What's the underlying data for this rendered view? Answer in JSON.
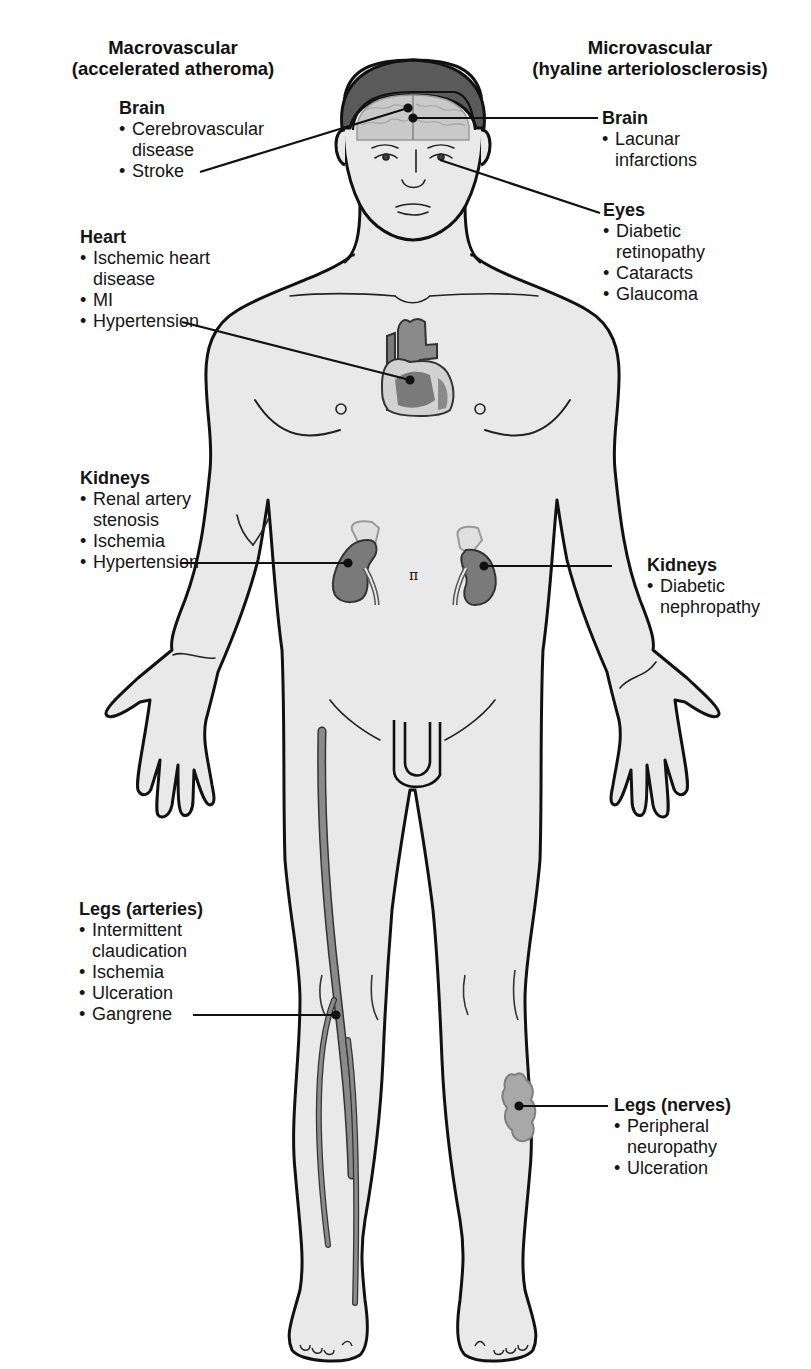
{
  "figure": {
    "colors": {
      "skin": "#e9e9e9",
      "outline": "#111111",
      "hair": "#5a5a5a",
      "organ": "#7a7a7a",
      "organ_light": "#d8d8d8",
      "artery": "#8a8a8a",
      "nerve_patch": "#a8a8a8"
    }
  },
  "categories": {
    "macrovascular": {
      "title": "Macrovascular",
      "subtitle": "(accelerated atheroma)"
    },
    "microvascular": {
      "title": "Microvascular",
      "subtitle": "(hyaline arteriolosclerosis)"
    }
  },
  "macrovascular": {
    "brain": {
      "heading": "Brain",
      "items": [
        "Cerebrovascular disease",
        "Stroke"
      ]
    },
    "heart": {
      "heading": "Heart",
      "items": [
        "Ischemic heart disease",
        "MI",
        "Hypertension"
      ]
    },
    "kidneys": {
      "heading": "Kidneys",
      "items": [
        "Renal artery stenosis",
        "Ischemia",
        "Hypertension"
      ]
    },
    "legs": {
      "heading": "Legs (arteries)",
      "items": [
        "Intermittent claudication",
        "Ischemia",
        "Ulceration",
        "Gangrene"
      ]
    }
  },
  "microvascular": {
    "brain": {
      "heading": "Brain",
      "items": [
        "Lacunar infarctions"
      ]
    },
    "eyes": {
      "heading": "Eyes",
      "items": [
        "Diabetic retinopathy",
        "Cataracts",
        "Glaucoma"
      ]
    },
    "kidneys": {
      "heading": "Kidneys",
      "items": [
        "Diabetic nephropathy"
      ]
    },
    "legs": {
      "heading": "Legs (nerves)",
      "items": [
        "Peripheral neuropathy",
        "Ulceration"
      ]
    }
  }
}
